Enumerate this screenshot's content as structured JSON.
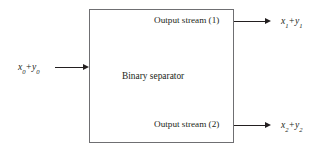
{
  "diagram": {
    "block": {
      "label": "Binary separator"
    },
    "input": {
      "expression_var1": "x",
      "expression_sub1": "0",
      "operator": "+",
      "expression_var2": "y",
      "expression_sub2": "0"
    },
    "outputs": [
      {
        "stream_label": "Output stream (1)",
        "expression_var1": "x",
        "expression_sub1": "1",
        "operator": "+",
        "expression_var2": "y",
        "expression_sub2": "1"
      },
      {
        "stream_label": "Output stream (2)",
        "expression_var1": "x",
        "expression_sub1": "2",
        "operator": "+",
        "expression_var2": "y",
        "expression_sub2": "2"
      }
    ],
    "colors": {
      "background": "#ffffff",
      "ink": "#231f20",
      "box_border": "#6f6f72"
    }
  }
}
